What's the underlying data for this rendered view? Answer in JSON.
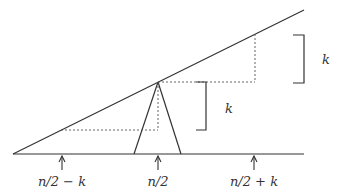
{
  "diagram": {
    "labels": {
      "bracket_upper": "k",
      "bracket_lower": "k",
      "tick_left": "n/2 − k",
      "tick_center": "n/2",
      "tick_right": "n/2 + k"
    },
    "colors": {
      "stroke": "#333333",
      "dotted": "#555555",
      "background": "#ffffff"
    }
  }
}
